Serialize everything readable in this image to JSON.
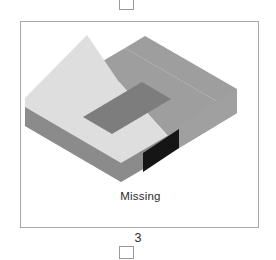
{
  "panel": {
    "caption": "Missing",
    "index_label": "3"
  },
  "markers": {
    "top_marker_name": "square-marker",
    "bottom_marker_name": "square-marker"
  },
  "colors": {
    "panel_border": "#a8a8a8",
    "marker_border": "#9a9a9a",
    "top_face_light": "#dcdcdc",
    "top_face_medium": "#9e9e9e",
    "slot_face": "#7b7b7b",
    "front_face_dark": "#8a8a8a",
    "front_face_mid": "#868686",
    "missing_face_black": "#141414",
    "right_face": "#a2a2a2",
    "background": "#ffffff",
    "text": "#2c2c2c"
  },
  "figure": {
    "name": "isometric-block-with-slot",
    "faces": [
      {
        "name": "top-light-face",
        "fill": "#dcdcdc",
        "points": "6,85 66,17 119,17 180,84 122,150"
      },
      {
        "name": "top-medium-face-rear",
        "fill": "#9e9e9e",
        "points": "66,17 124,-17 236,48 180,84 119,17"
      },
      {
        "name": "slot-face",
        "fill": "#7b7b7b",
        "points": "62,95 120,60 148,76 90,111"
      },
      {
        "name": "front-left-face",
        "fill": "#8a8a8a",
        "points": "6,85 6,104 122,170 122,150"
      },
      {
        "name": "missing-black-face",
        "fill": "#141414",
        "points": "122,150 155,131 155,151 122,170"
      },
      {
        "name": "right-face",
        "fill": "#a2a2a2",
        "points": "155,131 236,48 236,68 155,151"
      }
    ]
  }
}
